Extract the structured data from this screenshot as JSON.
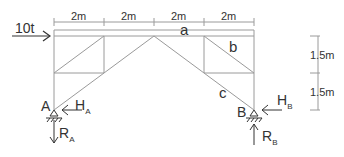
{
  "diagram": {
    "type": "truss",
    "load": {
      "label": "10t"
    },
    "dimensions": {
      "horizontal": [
        "2m",
        "2m",
        "2m",
        "2m"
      ],
      "vertical": [
        "1.5m",
        "1.5m"
      ]
    },
    "members": {
      "a": "a",
      "b": "b",
      "c": "c"
    },
    "supports": {
      "A": {
        "label": "A",
        "H": "H",
        "H_sub": "A",
        "R": "R",
        "R_sub": "A"
      },
      "B": {
        "label": "B",
        "H": "H",
        "H_sub": "B",
        "R": "R",
        "R_sub": "B"
      }
    },
    "colors": {
      "line": "#999999",
      "text": "#333333"
    }
  }
}
